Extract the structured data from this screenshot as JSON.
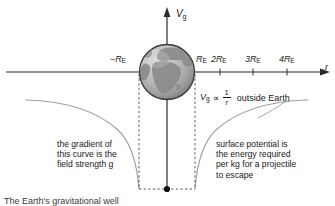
{
  "figure": {
    "title": "The Earth's gravitational well",
    "background_color": "#ffffff",
    "axis_color": "#2b2b2b",
    "curve_color": "#9a9a9a",
    "dash_color": "#555555",
    "text_color": "#1a1a1a"
  },
  "axes": {
    "vertical": {
      "label": "V",
      "label_sub": "g",
      "name": "gravitational potential"
    },
    "horizontal": {
      "label": "r",
      "name": "radial distance"
    }
  },
  "ticks": {
    "left": [
      {
        "value": "−R",
        "sub": "E"
      }
    ],
    "right": [
      {
        "value": "R",
        "sub": "E"
      },
      {
        "value": "2R",
        "sub": "E"
      },
      {
        "value": "3R",
        "sub": "E"
      },
      {
        "value": "4R",
        "sub": "E"
      }
    ]
  },
  "equation": {
    "var": "V",
    "var_sub": "g",
    "proportional": "∝",
    "numerator": "1",
    "denominator": "r",
    "tail": "outside Earth"
  },
  "annotations": {
    "left_caption": "the gradient of\nthis curve is the\nfield strength g",
    "right_caption": "surface potential is\nthe energy required\nper kg for a projectile\nto escape"
  },
  "earth": {
    "name": "earth-globe",
    "alt": "grayscale globe showing continents"
  }
}
